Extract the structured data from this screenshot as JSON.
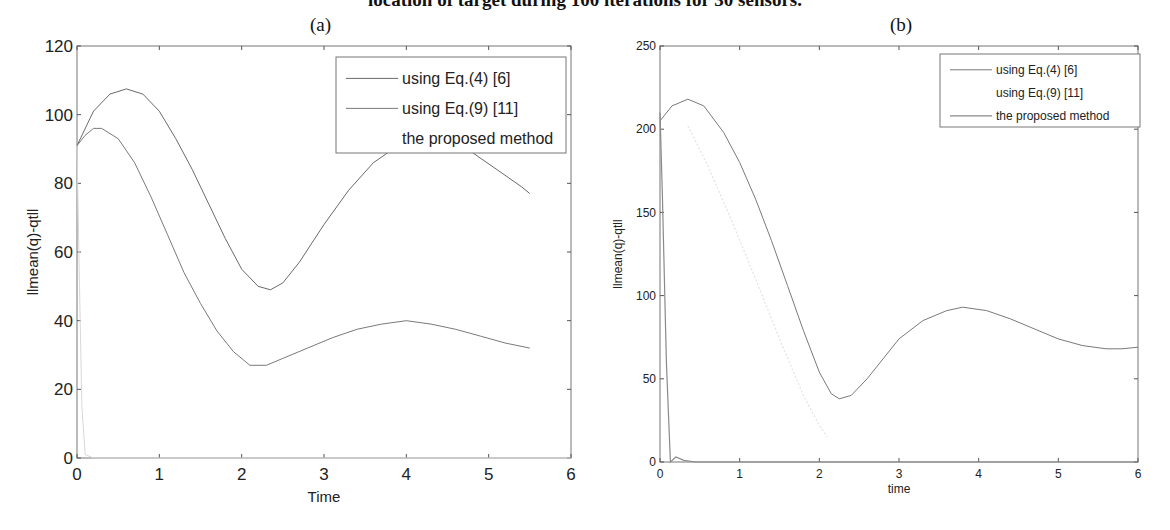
{
  "figure": {
    "title": "location of target during 100 iterations for 30 sensors."
  },
  "chart_data": [
    {
      "panel": "(a)",
      "type": "line",
      "title": "(a)",
      "xlabel": "Time",
      "ylabel": "llmean(q)-qtll",
      "xlim": [
        0,
        6
      ],
      "ylim": [
        0,
        120
      ],
      "xticks": [
        0,
        1,
        2,
        3,
        4,
        5,
        6
      ],
      "yticks": [
        0,
        20,
        40,
        60,
        80,
        100,
        120
      ],
      "grid": false,
      "legend_position": "upper right",
      "legend": [
        "using Eq.(4) [6]",
        "using Eq.(9) [11]",
        "the proposed method"
      ],
      "series": [
        {
          "name": "using Eq.(4) [6]",
          "x": [
            0,
            0.2,
            0.4,
            0.6,
            0.8,
            1.0,
            1.2,
            1.4,
            1.6,
            1.8,
            2.0,
            2.2,
            2.35,
            2.5,
            2.7,
            3.0,
            3.3,
            3.6,
            3.9,
            4.2,
            4.5,
            4.8,
            5.1,
            5.4,
            5.5
          ],
          "y": [
            91,
            101,
            106,
            107.5,
            106,
            101,
            93,
            84,
            74,
            64,
            55,
            50,
            49,
            51,
            57,
            68,
            78,
            86,
            91,
            93,
            92,
            89,
            84,
            79,
            77
          ]
        },
        {
          "name": "using Eq.(9) [11]",
          "x": [
            0,
            0.1,
            0.2,
            0.3,
            0.5,
            0.7,
            0.9,
            1.1,
            1.3,
            1.5,
            1.7,
            1.9,
            2.1,
            2.3,
            2.5,
            2.8,
            3.1,
            3.4,
            3.7,
            4.0,
            4.3,
            4.6,
            4.9,
            5.2,
            5.5
          ],
          "y": [
            91,
            94,
            96,
            96,
            93,
            86,
            76,
            65,
            54,
            45,
            37,
            31,
            27,
            27,
            29,
            32,
            35,
            37.5,
            39,
            40,
            39,
            37.5,
            35.5,
            33.5,
            32
          ]
        },
        {
          "name": "the proposed method",
          "x": [
            0,
            0.03,
            0.06,
            0.1,
            0.2,
            6
          ],
          "y": [
            91,
            50,
            15,
            1,
            0,
            0
          ]
        }
      ]
    },
    {
      "panel": "(b)",
      "type": "line",
      "title": "(b)",
      "xlabel": "time",
      "ylabel": "llmean(q)-qtll",
      "xlim": [
        0,
        6
      ],
      "ylim": [
        0,
        250
      ],
      "xticks": [
        0,
        1,
        2,
        3,
        4,
        5,
        6
      ],
      "yticks": [
        0,
        50,
        100,
        150,
        200,
        250
      ],
      "grid": false,
      "legend_position": "upper right",
      "legend": [
        "using Eq.(4) [6]",
        "using Eq.(9) [11]",
        "the proposed method"
      ],
      "series": [
        {
          "name": "using Eq.(4) [6]",
          "x": [
            0,
            0.15,
            0.35,
            0.55,
            0.8,
            1.0,
            1.2,
            1.4,
            1.6,
            1.8,
            2.0,
            2.15,
            2.25,
            2.4,
            2.6,
            2.8,
            3.0,
            3.3,
            3.6,
            3.8,
            4.1,
            4.4,
            4.7,
            5.0,
            5.3,
            5.6,
            5.8,
            6.0
          ],
          "y": [
            205,
            214,
            218,
            214,
            198,
            180,
            158,
            133,
            106,
            79,
            54,
            41,
            38,
            40,
            50,
            62,
            74,
            85,
            91,
            93,
            91,
            86,
            80,
            74,
            70,
            68,
            68,
            69
          ]
        },
        {
          "name": "using Eq.(9) [11]",
          "x": [
            0.35,
            0.6,
            0.9,
            1.2,
            1.5,
            1.8,
            2.0,
            2.1
          ],
          "y": [
            202,
            178,
            145,
            110,
            74,
            40,
            22,
            15
          ]
        },
        {
          "name": "the proposed method",
          "x": [
            0,
            0.03,
            0.08,
            0.13,
            0.2,
            0.3,
            0.45,
            6
          ],
          "y": [
            210,
            160,
            60,
            0,
            3,
            1,
            0,
            0
          ]
        }
      ]
    }
  ]
}
